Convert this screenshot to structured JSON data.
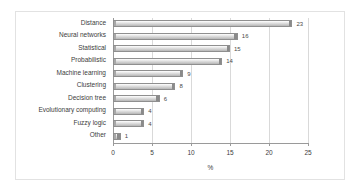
{
  "chart_data": {
    "type": "bar",
    "orientation": "horizontal",
    "title": "",
    "xlabel": "%",
    "ylabel": "",
    "xlim": [
      0,
      25
    ],
    "xticks": [
      0,
      5,
      10,
      15,
      20,
      25
    ],
    "grid": true,
    "legend": false,
    "categories": [
      "Distance",
      "Neural networks",
      "Statistical",
      "Probabilistic",
      "Machine learning",
      "Clustering",
      "Decision tree",
      "Evolutionary computing",
      "Fuzzy logic",
      "Other"
    ],
    "values": [
      23,
      16,
      15,
      14,
      9,
      8,
      6,
      4,
      4,
      1
    ],
    "value_labels": [
      "23",
      "16",
      "15",
      "14",
      "9",
      "8",
      "6",
      "4",
      "4",
      "1"
    ],
    "colors": {
      "bar_fill": "#d7d7d7",
      "bar_edge": "#8f8f8f",
      "grid": "#d9d9d9",
      "axis": "#9a9a9a",
      "text": "#3c3c3c",
      "frame": "#e2e2e2",
      "background": "#ffffff"
    }
  },
  "axis": {
    "tick_labels": [
      "0",
      "5",
      "10",
      "15",
      "20",
      "25"
    ],
    "x_title": "%"
  }
}
